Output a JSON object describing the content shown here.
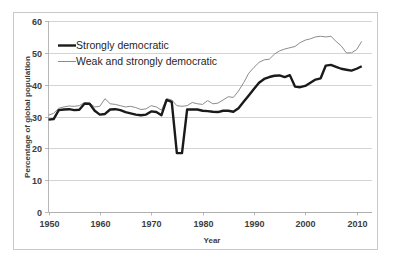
{
  "chart_data": {
    "type": "line",
    "title": "",
    "xlabel": "Year",
    "ylabel": "Percentage of global population",
    "xlim": [
      1950,
      2013
    ],
    "ylim": [
      0,
      60
    ],
    "xticks": [
      1950,
      1960,
      1970,
      1980,
      1990,
      2000,
      2010
    ],
    "yticks": [
      0,
      10,
      20,
      30,
      40,
      50,
      60
    ],
    "xtick_labels": [
      "1950",
      "1960",
      "1970",
      "1980",
      "1990",
      "2000",
      "2010"
    ],
    "ytick_labels": [
      "0",
      "10",
      "20",
      "30",
      "40",
      "50",
      "60"
    ],
    "grid": "horizontal",
    "legend_position": "upper-left-inside",
    "colors": {
      "strongly_democratic": "#1a1a1a",
      "weak_and_strongly_democratic": "#8c8c8c",
      "gridline": "#c2c2c2",
      "frame": "#c9c9c9",
      "text": "#3d3d3d"
    },
    "x": [
      1950,
      1951,
      1952,
      1953,
      1954,
      1955,
      1956,
      1957,
      1958,
      1959,
      1960,
      1961,
      1962,
      1963,
      1964,
      1965,
      1966,
      1967,
      1968,
      1969,
      1970,
      1971,
      1972,
      1973,
      1974,
      1975,
      1976,
      1977,
      1978,
      1979,
      1980,
      1981,
      1982,
      1983,
      1984,
      1985,
      1986,
      1987,
      1988,
      1989,
      1990,
      1991,
      1992,
      1993,
      1994,
      1995,
      1996,
      1997,
      1998,
      1999,
      2000,
      2001,
      2002,
      2003,
      2004,
      2005,
      2006,
      2007,
      2008,
      2009,
      2010,
      2011
    ],
    "series": [
      {
        "name": "Strongly democratic",
        "style": "thick-black",
        "values": [
          29.0,
          29.2,
          32.0,
          32.2,
          32.3,
          32.0,
          32.1,
          34.0,
          34.0,
          31.8,
          30.6,
          30.8,
          32.2,
          32.3,
          32.0,
          31.4,
          31.0,
          30.6,
          30.4,
          30.6,
          31.6,
          31.4,
          30.4,
          35.2,
          34.6,
          18.5,
          18.5,
          32.2,
          32.2,
          32.2,
          31.8,
          31.7,
          31.5,
          31.4,
          31.8,
          31.8,
          31.5,
          32.6,
          34.6,
          36.6,
          38.6,
          40.6,
          41.8,
          42.4,
          42.8,
          42.9,
          42.4,
          43.0,
          39.4,
          39.2,
          39.6,
          40.6,
          41.6,
          42.0,
          46.0,
          46.2,
          45.6,
          45.0,
          44.7,
          44.4,
          45.0,
          45.8
        ]
      },
      {
        "name": "Weak and strongly democratic",
        "style": "thin-gray",
        "values": [
          30.4,
          31.0,
          32.6,
          33.0,
          33.3,
          33.2,
          33.4,
          34.4,
          34.2,
          33.0,
          33.2,
          35.6,
          34.0,
          33.8,
          33.4,
          33.0,
          33.2,
          32.8,
          32.2,
          32.4,
          33.4,
          33.0,
          32.0,
          35.6,
          35.2,
          33.4,
          33.2,
          33.4,
          34.4,
          34.0,
          33.8,
          35.0,
          34.0,
          34.2,
          35.2,
          36.2,
          36.0,
          38.0,
          40.6,
          43.6,
          45.4,
          47.0,
          47.8,
          48.0,
          49.6,
          50.6,
          51.2,
          51.6,
          52.0,
          53.2,
          54.0,
          54.4,
          55.0,
          55.2,
          55.0,
          55.2,
          53.6,
          52.2,
          50.0,
          50.0,
          51.0,
          53.6
        ]
      }
    ],
    "annotations": [
      {
        "text": "Deep dip in strongly democratic share circa 1975-1976 to about 18.5%"
      }
    ]
  },
  "legend": {
    "items": [
      {
        "label": "Strongly democratic",
        "marker": "thick-black-line"
      },
      {
        "label": "Weak and strongly democratic",
        "marker": "thin-gray-line"
      }
    ]
  },
  "axes": {
    "x_title": "Year",
    "y_title": "Percentage of global population"
  }
}
